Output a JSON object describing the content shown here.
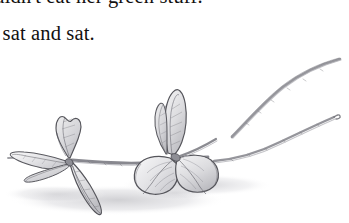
{
  "page": {
    "background_color": "#ffffff",
    "text_color": "#12100f"
  },
  "text": {
    "lines": [
      {
        "id": "line-1",
        "content": "wouldn't eat her green stuff.",
        "clipped": "top-and-left"
      },
      {
        "id": "line-2",
        "content": "e sat and sat.",
        "clipped": "left"
      }
    ]
  },
  "illustration": {
    "title": "pencil drawing of a leafy branch",
    "medium": "graphite pencil sketch",
    "subject": "branch with leaf clusters and two bare stems",
    "colors": {
      "outline": "#5a5a5e",
      "outline_dark": "#3a3a3e",
      "fill_light": "#f0f0f1",
      "fill_mid": "#d9d9dc",
      "fill_shade": "#c2c2c6",
      "shadow": "#d5d5d8",
      "stem": "#8c8c92"
    },
    "parts": [
      {
        "name": "upper-right-stem",
        "description": "long curving bare stem sweeping to the upper right corner"
      },
      {
        "name": "lower-right-stem",
        "description": "second bare stem angling to the middle right edge"
      },
      {
        "name": "center-leaf-cluster",
        "description": "three leaves: one pointed leaf upright, two rounded leaves below"
      },
      {
        "name": "left-leaf-cluster",
        "description": "four leaves radiating from a node, one hanging downward"
      },
      {
        "name": "main-stem",
        "description": "horizontal stem joining the left and center leaf clusters"
      },
      {
        "name": "cast-shadow",
        "description": "soft grey wash beneath the branch suggesting a surface"
      }
    ]
  }
}
